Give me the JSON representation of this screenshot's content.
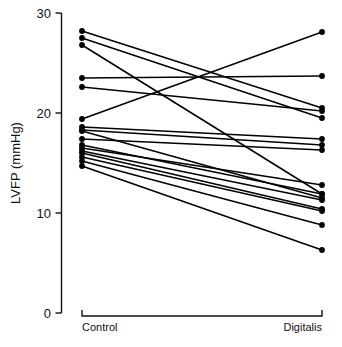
{
  "chart_data": {
    "type": "line",
    "title": "",
    "subtitle": "",
    "xlabel": "",
    "ylabel": "LVFP (mmHg)",
    "categories": [
      "Control",
      "Digitalis"
    ],
    "x": [
      0,
      1
    ],
    "ylim": [
      0,
      30
    ],
    "xlim": [
      -0.08,
      1.08
    ],
    "y_ticks": [
      0,
      10,
      20,
      30
    ],
    "y_tick_labels": [
      "0",
      "10",
      "20",
      "30"
    ],
    "x_tick_labels": [
      "Control",
      "Digitalis"
    ],
    "grid": false,
    "legend": "none",
    "marker": "filled-circle",
    "line_color": "#000000",
    "marker_color": "#000000",
    "paired": true,
    "n_subjects": 17,
    "annotations": [],
    "series": [
      {
        "name": "subject-1",
        "values": [
          28.2,
          20.5
        ]
      },
      {
        "name": "subject-2",
        "values": [
          27.5,
          19.5
        ]
      },
      {
        "name": "subject-3",
        "values": [
          26.8,
          11.9
        ]
      },
      {
        "name": "subject-4",
        "values": [
          23.5,
          23.7
        ]
      },
      {
        "name": "subject-5",
        "values": [
          22.6,
          20.2
        ]
      },
      {
        "name": "subject-6",
        "values": [
          19.4,
          28.1
        ]
      },
      {
        "name": "subject-7",
        "values": [
          18.6,
          17.4
        ]
      },
      {
        "name": "subject-8",
        "values": [
          18.3,
          16.8
        ]
      },
      {
        "name": "subject-9",
        "values": [
          18.2,
          11.5
        ]
      },
      {
        "name": "subject-10",
        "values": [
          17.4,
          16.3
        ]
      },
      {
        "name": "subject-11",
        "values": [
          16.8,
          11.9
        ]
      },
      {
        "name": "subject-12",
        "values": [
          16.5,
          12.8
        ]
      },
      {
        "name": "subject-13",
        "values": [
          16.2,
          11.3
        ]
      },
      {
        "name": "subject-14",
        "values": [
          16.0,
          10.4
        ]
      },
      {
        "name": "subject-15",
        "values": [
          15.6,
          10.2
        ]
      },
      {
        "name": "subject-16",
        "values": [
          15.2,
          8.8
        ]
      },
      {
        "name": "subject-17",
        "values": [
          14.7,
          6.3
        ]
      }
    ]
  },
  "axes": {
    "y_axis_label": "LVFP (mmHg)",
    "y_tick_0": "0",
    "y_tick_10": "10",
    "y_tick_20": "20",
    "y_tick_30": "30",
    "group_left": "Control",
    "group_right": "Digitalis"
  }
}
